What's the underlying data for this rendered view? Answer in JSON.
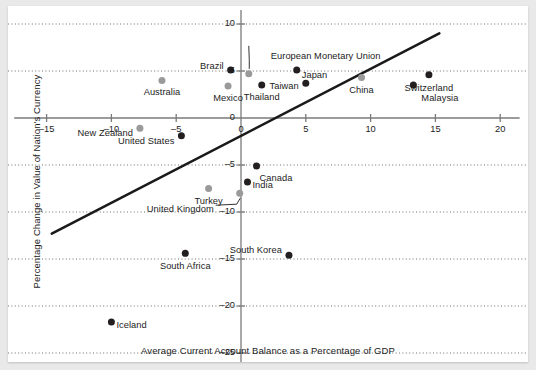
{
  "figure": {
    "background": "#e9e9e9",
    "card_background": "#ffffff"
  },
  "chart_data": {
    "type": "scatter",
    "title": "",
    "xlabel": "Average Current Account Balance as a Percentage of GDP",
    "ylabel": "Percentage Change in Value of Nation's Currency",
    "xlim": [
      -17.5,
      21.5
    ],
    "ylim": [
      -27,
      11.5
    ],
    "xticks": [
      -15,
      -10,
      -5,
      0,
      5,
      10,
      15,
      20
    ],
    "xtick_labels": [
      "–15",
      "–10",
      "–5",
      "0",
      "5",
      "10",
      "15",
      "20"
    ],
    "yticks": [
      10,
      5,
      0,
      -5,
      -10,
      -15,
      -20,
      -25
    ],
    "ytick_labels": [
      "10",
      "5",
      "0",
      "–5",
      "–10",
      "–15",
      "–20",
      "–25"
    ],
    "grid": "horizontal-dotted",
    "legend": "none",
    "colors": {
      "dark_marker": "#231f20",
      "light_marker": "#9a9a9a",
      "trendline": "#1a1a1a",
      "axis": "#7a7a7a",
      "gridline": "#6f6f6f",
      "text": "#1c1c1c"
    },
    "trendline": {
      "label": "",
      "x_start": -14.6,
      "y_start": -12.3,
      "x_end": 15.3,
      "y_end": 9.0
    },
    "points": [
      {
        "name": "Australia",
        "x": -6.1,
        "y": 4.0,
        "shade": "light",
        "label_dx": 0,
        "label_dy": 13,
        "align": "center"
      },
      {
        "name": "New Zealand",
        "x": -7.8,
        "y": -1.1,
        "shade": "light",
        "label_dx": -7,
        "label_dy": 6,
        "align": "right"
      },
      {
        "name": "United States",
        "x": -4.6,
        "y": -1.9,
        "shade": "dark",
        "label_dx": -7,
        "label_dy": 6,
        "align": "right"
      },
      {
        "name": "Mexico",
        "x": -1.0,
        "y": 3.4,
        "shade": "light",
        "label_dx": 0,
        "label_dy": 13,
        "align": "center"
      },
      {
        "name": "Brazil",
        "x": -0.8,
        "y": 5.1,
        "shade": "dark",
        "label_dx": -7,
        "label_dy": -3,
        "align": "right"
      },
      {
        "name": "European Monetary Union",
        "x": 0.6,
        "y": 4.7,
        "shade": "light",
        "label_dx": 22,
        "label_dy": -17,
        "align": "left"
      },
      {
        "name": "Thailand",
        "x": 1.6,
        "y": 3.5,
        "shade": "dark",
        "label_dx": 0,
        "label_dy": 13,
        "align": "center"
      },
      {
        "name": "Japan",
        "x": 4.3,
        "y": 5.1,
        "shade": "dark",
        "label_dx": 5,
        "label_dy": 6,
        "align": "left"
      },
      {
        "name": "Taiwan",
        "x": 5.0,
        "y": 3.7,
        "shade": "dark",
        "label_dx": -7,
        "label_dy": 4,
        "align": "right"
      },
      {
        "name": "China",
        "x": 9.3,
        "y": 4.3,
        "shade": "light",
        "label_dx": 0,
        "label_dy": 13,
        "align": "center"
      },
      {
        "name": "Malaysia",
        "x": 13.3,
        "y": 3.5,
        "shade": "dark",
        "label_dx": 8,
        "label_dy": 14,
        "align": "left"
      },
      {
        "name": "Switzerland",
        "x": 14.5,
        "y": 4.6,
        "shade": "dark",
        "label_dx": 0,
        "label_dy": 14,
        "align": "center"
      },
      {
        "name": "Canada",
        "x": 1.2,
        "y": -5.1,
        "shade": "dark",
        "label_dx": 3,
        "label_dy": 13,
        "align": "left"
      },
      {
        "name": "Turkey",
        "x": -2.5,
        "y": -7.5,
        "shade": "light",
        "label_dx": 0,
        "label_dy": 13,
        "align": "center"
      },
      {
        "name": "India",
        "x": 0.5,
        "y": -6.8,
        "shade": "dark",
        "label_dx": 5,
        "label_dy": 4,
        "align": "left"
      },
      {
        "name": "United Kingdom",
        "x": -0.1,
        "y": -8.0,
        "shade": "light",
        "label_dx": -26,
        "label_dy": 17,
        "align": "right"
      },
      {
        "name": "South Korea",
        "x": 3.7,
        "y": -14.6,
        "shade": "dark",
        "label_dx": -7,
        "label_dy": -4,
        "align": "right"
      },
      {
        "name": "South Africa",
        "x": -4.3,
        "y": -14.4,
        "shade": "dark",
        "label_dx": 0,
        "label_dy": 14,
        "align": "center"
      },
      {
        "name": "Iceland",
        "x": -10.0,
        "y": -21.7,
        "shade": "dark",
        "label_dx": 5,
        "label_dy": 4,
        "align": "left"
      }
    ]
  }
}
